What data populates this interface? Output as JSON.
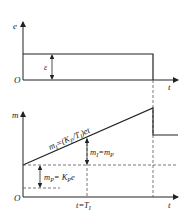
{
  "top_plot": {
    "y_axis_label": "e",
    "x_axis_label": "t",
    "origin_label": "O",
    "step_label": "ε"
  },
  "bottom_plot": {
    "y_axis_label": "m",
    "x_axis_label": "t",
    "origin_label": "O",
    "ramp_label": "m_I=(K_P/T_I)et",
    "ramp_label_parts": {
      "m": "m",
      "sub1": "I",
      "eq": "=(K",
      "sub2": "P",
      "mid": "/T",
      "sub3": "I",
      "end": ")et"
    },
    "integral_equals_label": {
      "m": "m",
      "sub1": "I",
      "eq": "=m",
      "sub2": "P"
    },
    "proportional_label": {
      "m": "m",
      "sub1": "P",
      "eq": "= K",
      "sub2": "P",
      "end": "e"
    },
    "time_marker_label": {
      "t": "t",
      "eq": "=T",
      "sub": "I"
    }
  },
  "colors": {
    "line": "#222222",
    "dashed": "#555555",
    "background": "#ffffff"
  }
}
